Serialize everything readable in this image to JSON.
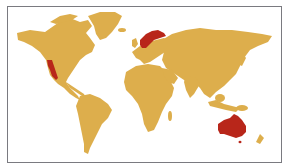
{
  "map": {
    "type": "world-map",
    "colors": {
      "land": "#DDAE4C",
      "highlight": "#B8261A",
      "background": "#FFFFFF",
      "border": "#7A7A80"
    },
    "highlighted_regions": [
      "California (US West Coast)",
      "Scandinavia",
      "Australia"
    ],
    "continents": [
      "North America",
      "Greenland",
      "South America",
      "Europe",
      "Africa",
      "Asia",
      "Australia",
      "New Zealand"
    ]
  }
}
